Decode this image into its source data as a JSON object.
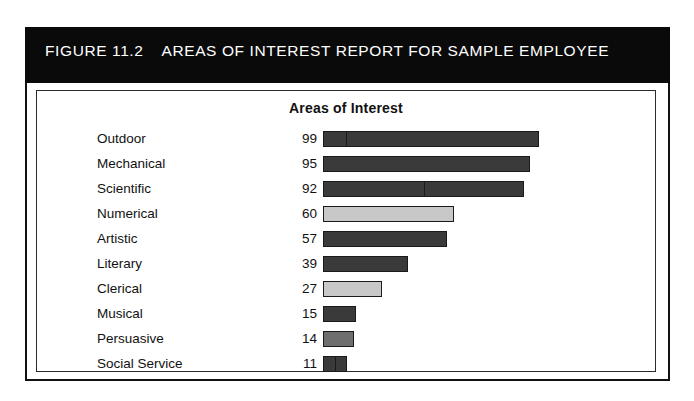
{
  "figure": {
    "number": "FIGURE 11.2",
    "title": "AREAS OF INTEREST REPORT FOR SAMPLE EMPLOYEE",
    "band_color": "#0a0a0a",
    "band_text_color": "#ffffff",
    "frame_color": "#111111"
  },
  "chart_data": {
    "type": "bar",
    "orientation": "horizontal",
    "title": "Areas of Interest",
    "subtitle": "",
    "xlabel": "",
    "ylabel": "",
    "xlim": [
      0,
      100
    ],
    "grid": false,
    "legend": "none",
    "value_labels_shown": true,
    "categories": [
      "Outdoor",
      "Mechanical",
      "Scientific",
      "Numerical",
      "Artistic",
      "Literary",
      "Clerical",
      "Musical",
      "Persuasive",
      "Social Service"
    ],
    "values": [
      99,
      95,
      92,
      60,
      57,
      39,
      27,
      15,
      14,
      11
    ],
    "bars": [
      {
        "category": "Outdoor",
        "value": 99,
        "color": "#3a3a3a",
        "split_at": 10
      },
      {
        "category": "Mechanical",
        "value": 95,
        "color": "#3a3a3a",
        "split_at": null
      },
      {
        "category": "Scientific",
        "value": 92,
        "color": "#3a3a3a",
        "split_at": 46
      },
      {
        "category": "Numerical",
        "value": 60,
        "color": "#c8c8c8",
        "split_at": null
      },
      {
        "category": "Artistic",
        "value": 57,
        "color": "#3a3a3a",
        "split_at": null
      },
      {
        "category": "Literary",
        "value": 39,
        "color": "#3a3a3a",
        "split_at": null
      },
      {
        "category": "Clerical",
        "value": 27,
        "color": "#c8c8c8",
        "split_at": null
      },
      {
        "category": "Musical",
        "value": 15,
        "color": "#3a3a3a",
        "split_at": null
      },
      {
        "category": "Persuasive",
        "value": 14,
        "color": "#6e6e6e",
        "split_at": null
      },
      {
        "category": "Social Service",
        "value": 11,
        "color": "#3a3a3a",
        "split_at": 5
      }
    ]
  }
}
